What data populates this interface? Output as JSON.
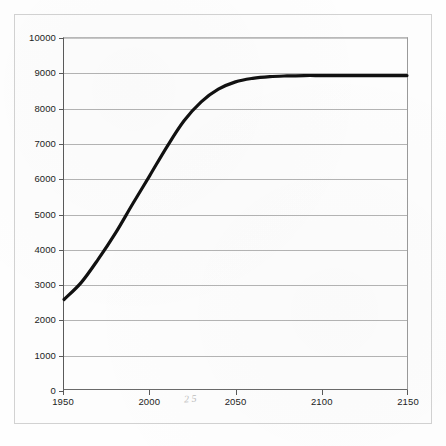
{
  "chart_data": {
    "type": "line",
    "title": "",
    "subtitle": "",
    "xlabel": "",
    "ylabel": "",
    "xlim": [
      1950,
      2150
    ],
    "ylim": [
      0,
      10000
    ],
    "grid": true,
    "legend_position": "none",
    "x_ticks": [
      1950,
      2000,
      2050,
      2100,
      2150
    ],
    "x_tick_labels": [
      "1950",
      "2000",
      "2050",
      "2100",
      "2150"
    ],
    "y_ticks": [
      0,
      1000,
      2000,
      3000,
      4000,
      5000,
      6000,
      7000,
      8000,
      9000,
      10000
    ],
    "y_tick_labels": [
      "0",
      "1000",
      "2000",
      "3000",
      "4000",
      "5000",
      "6000",
      "7000",
      "8000",
      "9000",
      "10000"
    ],
    "series": [
      {
        "name": "World population projection",
        "color": "#111111",
        "line_width": 3.2,
        "x": [
          1950,
          1960,
          1970,
          1980,
          1990,
          2000,
          2010,
          2020,
          2030,
          2040,
          2050,
          2060,
          2070,
          2080,
          2090,
          2100,
          2110,
          2120,
          2130,
          2140,
          2150
        ],
        "values": [
          2550,
          3030,
          3700,
          4440,
          5270,
          6080,
          6900,
          7640,
          8180,
          8540,
          8750,
          8850,
          8900,
          8920,
          8930,
          8930,
          8930,
          8930,
          8930,
          8930,
          8930
        ]
      }
    ],
    "annotations": [
      {
        "name": "scan-artifact",
        "text": "2 5",
        "x": 2025,
        "y": 0
      }
    ]
  },
  "figure": {
    "background_color": "#fefefe",
    "frame_color": "#d2d2d2",
    "axis_color": "#5a5a5a",
    "gridline_color": "#b4b4b4",
    "tick_label_color": "#1c1c1c"
  }
}
